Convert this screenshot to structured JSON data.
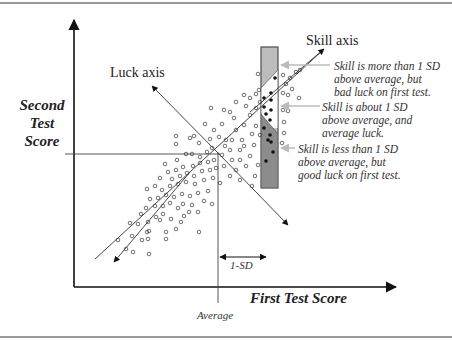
{
  "diagram": {
    "y_axis_label": [
      "Second",
      "Test",
      "Score"
    ],
    "x_axis_label": "First Test Score",
    "skill_axis_label": "Skill axis",
    "luck_axis_label": "Luck axis",
    "average_label": "Average",
    "sd_label": "1-SD",
    "annotations": [
      {
        "lines": "Skill is more than 1 SD\nabove average, but\nbad luck on first test."
      },
      {
        "lines": "Skill is about 1 SD\nabove average, and\naverage luck."
      },
      {
        "lines": "Skill is less than 1 SD\nabove average, but\ngood luck on first test."
      }
    ],
    "colors": {
      "axis": "#111111",
      "box_light": "#bcbcbc",
      "box_dark": "#8c8c8c",
      "pointer_arrow": "#bbbbbb",
      "frame": "#9a9a9a"
    }
  }
}
